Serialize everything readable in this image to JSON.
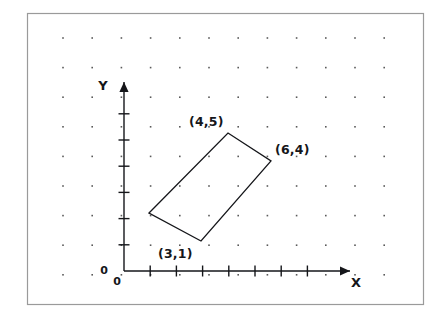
{
  "figure": {
    "title_alt": "Rectangle plotted on an X-Y coordinate grid",
    "frame": {
      "border_color": "#9a9a9a",
      "background_color": "#ffffff",
      "x": 27,
      "y": 13,
      "width": 397,
      "height": 292
    },
    "dot_grid": {
      "color": "#5a5a5a",
      "columns": 12,
      "rows": 10,
      "start_x": 63,
      "start_y": 38,
      "step_x": 29.2,
      "step_y": 29.6,
      "dot_size": 1.6
    },
    "axes": {
      "color": "#15161a",
      "origin": {
        "x": 124,
        "y": 271
      },
      "x_axis": {
        "label": "X",
        "label_x": 356,
        "label_y": 287,
        "end_x": 350,
        "tick_count": 7,
        "tick_step": 26.2,
        "tick_length": 11,
        "zero_label": "0",
        "zero_label_x": 117,
        "zero_label_y": 285
      },
      "y_axis": {
        "label": "Y",
        "label_x": 103,
        "label_y": 90,
        "end_y": 82,
        "tick_count": 6,
        "tick_step": 26.2,
        "tick_length": 11,
        "zero_label": "0",
        "zero_label_x": 104,
        "zero_label_y": 274
      }
    },
    "shape": {
      "name": "rectangle",
      "stroke_color": "#15161a",
      "stroke_width": 1.3,
      "fill": "none",
      "vertices": [
        {
          "label": "(3,1)",
          "px": 201,
          "py": 241,
          "label_x": 158,
          "label_y": 258
        },
        {
          "label": "(4,5)",
          "px": 228,
          "py": 133,
          "label_x": 189,
          "label_y": 126
        },
        {
          "label": "(6,4)",
          "px": 271,
          "py": 161,
          "label_x": 275,
          "label_y": 154
        },
        {
          "label": "",
          "px": 149,
          "py": 213,
          "label_x": 0,
          "label_y": 0
        }
      ],
      "path": "M 149 213 L 228 133 L 271 161 L 201 241 Z"
    }
  },
  "chart_data": {
    "type": "scatter",
    "title": "",
    "xlabel": "X",
    "ylabel": "Y",
    "xlim": [
      0,
      8
    ],
    "ylim": [
      0,
      7
    ],
    "grid": false,
    "x_ticks": [
      1,
      2,
      3,
      4,
      5,
      6,
      7
    ],
    "y_ticks": [
      1,
      2,
      3,
      4,
      5,
      6
    ],
    "x_tick_labels": [],
    "y_tick_labels": [],
    "origin_label": "0",
    "annotations": [
      "(3,1)",
      "(4,5)",
      "(6,4)"
    ],
    "series": [
      {
        "name": "rectangle",
        "closed": true,
        "points": [
          {
            "x": 3,
            "y": 1,
            "label": "(3,1)"
          },
          {
            "x": 1,
            "y": 4,
            "label": ""
          },
          {
            "x": 4,
            "y": 5,
            "label": "(4,5)"
          },
          {
            "x": 6,
            "y": 4,
            "label": "(6,4)"
          }
        ]
      }
    ]
  }
}
